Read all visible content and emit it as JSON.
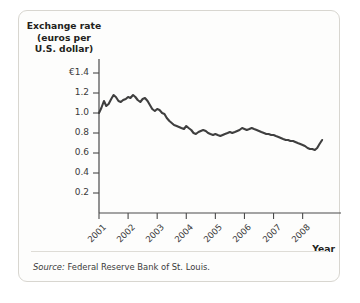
{
  "figure": {
    "y_axis_title": "Exchange rate\n(euros per\nU.S. dollar)",
    "x_axis_title": "Year",
    "source_label": "Source:",
    "source_text": "Federal Reserve Bank of St. Louis.",
    "line_color": "#3f3f3f",
    "axis_color": "#4a4a4a",
    "border_color": "#d8d6d0"
  },
  "chart_data": {
    "type": "line",
    "title": "",
    "xlabel": "Year",
    "ylabel": "Exchange rate (euros per U.S. dollar)",
    "ylim": [
      0,
      1.4
    ],
    "xlim": [
      2001,
      2008.7
    ],
    "grid": false,
    "legend": "none",
    "y_ticks": [
      {
        "value": 1.4,
        "label": "€1.4"
      },
      {
        "value": 1.2,
        "label": "1.2"
      },
      {
        "value": 1.0,
        "label": "1.0"
      },
      {
        "value": 0.8,
        "label": "0.8"
      },
      {
        "value": 0.6,
        "label": "0.6"
      },
      {
        "value": 0.4,
        "label": "0.4"
      },
      {
        "value": 0.2,
        "label": "0.2"
      }
    ],
    "x_ticks": [
      {
        "value": 2001,
        "label": "2001"
      },
      {
        "value": 2002,
        "label": "2002"
      },
      {
        "value": 2003,
        "label": "2003"
      },
      {
        "value": 2004,
        "label": "2004"
      },
      {
        "value": 2005,
        "label": "2005"
      },
      {
        "value": 2006,
        "label": "2006"
      },
      {
        "value": 2007,
        "label": "2007"
      },
      {
        "value": 2008,
        "label": "2008"
      }
    ],
    "series": [
      {
        "name": "Euros per U.S. dollar",
        "x": [
          2001.0,
          2001.08,
          2001.17,
          2001.25,
          2001.33,
          2001.42,
          2001.5,
          2001.58,
          2001.67,
          2001.75,
          2001.83,
          2001.92,
          2002.0,
          2002.08,
          2002.17,
          2002.25,
          2002.33,
          2002.42,
          2002.5,
          2002.58,
          2002.67,
          2002.75,
          2002.83,
          2002.92,
          2003.0,
          2003.08,
          2003.17,
          2003.25,
          2003.33,
          2003.42,
          2003.5,
          2003.58,
          2003.67,
          2003.75,
          2003.83,
          2003.92,
          2004.0,
          2004.08,
          2004.17,
          2004.25,
          2004.33,
          2004.42,
          2004.5,
          2004.58,
          2004.67,
          2004.75,
          2004.83,
          2004.92,
          2005.0,
          2005.08,
          2005.17,
          2005.25,
          2005.33,
          2005.42,
          2005.5,
          2005.58,
          2005.67,
          2005.75,
          2005.83,
          2005.92,
          2006.0,
          2006.08,
          2006.17,
          2006.25,
          2006.33,
          2006.42,
          2006.5,
          2006.58,
          2006.67,
          2006.75,
          2006.83,
          2006.92,
          2007.0,
          2007.08,
          2007.17,
          2007.25,
          2007.33,
          2007.42,
          2007.5,
          2007.58,
          2007.67,
          2007.75,
          2007.83,
          2007.92,
          2008.0,
          2008.08,
          2008.17,
          2008.25,
          2008.33,
          2008.42,
          2008.5,
          2008.58,
          2008.67
        ],
        "y": [
          1.0,
          1.05,
          1.12,
          1.07,
          1.09,
          1.14,
          1.18,
          1.16,
          1.12,
          1.11,
          1.13,
          1.14,
          1.16,
          1.15,
          1.18,
          1.16,
          1.13,
          1.11,
          1.14,
          1.15,
          1.12,
          1.08,
          1.04,
          1.02,
          1.04,
          1.03,
          1.0,
          0.99,
          0.95,
          0.92,
          0.9,
          0.88,
          0.87,
          0.86,
          0.85,
          0.84,
          0.87,
          0.85,
          0.83,
          0.8,
          0.79,
          0.81,
          0.82,
          0.83,
          0.82,
          0.8,
          0.79,
          0.78,
          0.79,
          0.78,
          0.77,
          0.78,
          0.79,
          0.8,
          0.81,
          0.8,
          0.81,
          0.82,
          0.83,
          0.85,
          0.84,
          0.83,
          0.84,
          0.85,
          0.84,
          0.83,
          0.82,
          0.81,
          0.8,
          0.79,
          0.79,
          0.78,
          0.78,
          0.77,
          0.76,
          0.75,
          0.74,
          0.73,
          0.73,
          0.72,
          0.72,
          0.71,
          0.7,
          0.69,
          0.68,
          0.67,
          0.65,
          0.64,
          0.64,
          0.63,
          0.65,
          0.69,
          0.73
        ]
      }
    ]
  }
}
